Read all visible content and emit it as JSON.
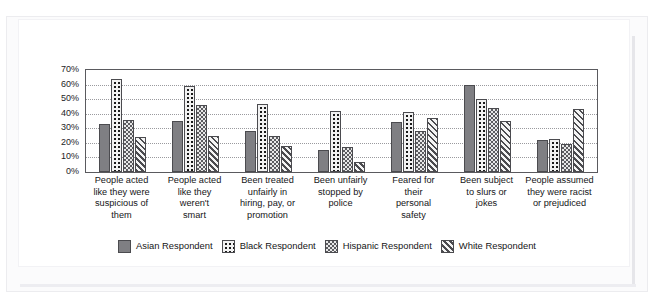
{
  "page": {
    "cropped_header_text": "",
    "background_color": "#ffffff",
    "card_color": "#ffffff"
  },
  "chart_data": {
    "type": "bar",
    "title": "",
    "subtitle": "",
    "xlabel": "",
    "ylabel": "",
    "ylim": [
      0,
      70
    ],
    "ytick_labels": [
      "70%",
      "60%",
      "50%",
      "40%",
      "30%",
      "20%",
      "10%",
      "0%"
    ],
    "ytick_values": [
      70,
      60,
      50,
      40,
      30,
      20,
      10,
      0
    ],
    "grid": true,
    "grid_axis": "y",
    "legend_position": "bottom",
    "value_unit": "%",
    "categories": [
      "People acted like they were suspicious of them",
      "People acted like they weren't smart",
      "Been treated unfairly in hiring, pay, or promotion",
      "Been unfairly stopped by police",
      "Feared for their personal safety",
      "Been subject to slurs or jokes",
      "People assumed they were racist or prejudiced"
    ],
    "category_lines": [
      [
        "People acted",
        "like they were",
        "suspicious of",
        "them"
      ],
      [
        "People acted",
        "like they",
        "weren't",
        "smart"
      ],
      [
        "Been treated",
        "unfairly in",
        "hiring, pay, or",
        "promotion"
      ],
      [
        "Been unfairly",
        "stopped by",
        "police"
      ],
      [
        "Feared for",
        "their",
        "personal",
        "safety"
      ],
      [
        "Been subject",
        "to slurs or",
        "jokes"
      ],
      [
        "People assumed",
        "they were racist",
        "or prejudiced"
      ]
    ],
    "series": [
      {
        "name": "Asian Respondent",
        "pattern": "solid-gray",
        "color": "#7f7f83",
        "values": [
          33,
          35,
          28,
          15,
          34,
          60,
          22
        ]
      },
      {
        "name": "Black Respondent",
        "pattern": "dotted",
        "color": "#1a1a1a",
        "values": [
          64,
          59,
          47,
          42,
          41,
          50,
          23
        ]
      },
      {
        "name": "Hispanic Respondent",
        "pattern": "checkered",
        "color": "#5c5c60",
        "values": [
          36,
          46,
          25,
          17,
          28,
          44,
          19
        ]
      },
      {
        "name": "White Respondent",
        "pattern": "diagonal-stripes",
        "color": "#4b4b4f",
        "values": [
          24,
          25,
          18,
          7,
          37,
          35,
          43
        ]
      }
    ]
  }
}
